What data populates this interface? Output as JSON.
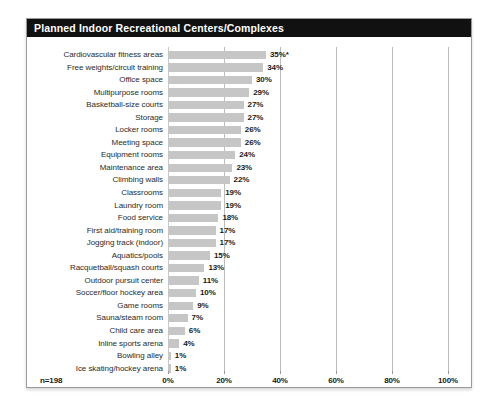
{
  "card": {
    "title": "Planned Indoor Recreational Centers/Complexes",
    "footnote": "n=198"
  },
  "axis": {
    "ticks": [
      "0%",
      "20%",
      "40%",
      "60%",
      "80%",
      "100%"
    ],
    "tick_values": [
      0,
      20,
      40,
      60,
      80,
      100
    ]
  },
  "colors": {
    "title_bar": "#111111",
    "title_text": "#ffffff",
    "bar_fill": "#c6c6c6",
    "gridline": "#bdbdbd",
    "card_border": "#9a9a9a",
    "label_text": "#2b2b2b",
    "value_text": "#1a1a1a"
  },
  "chart_data": {
    "type": "bar",
    "orientation": "horizontal",
    "title": "Planned Indoor Recreational Centers/Complexes",
    "xlabel": "",
    "ylabel": "",
    "xlim": [
      0,
      100
    ],
    "grid": true,
    "legend": null,
    "sample_size": "n=198",
    "annotations": [
      "35%* includes an asterisk footnote marker"
    ],
    "categories": [
      "Cardiovascular fitness areas",
      "Free weights/circuit training",
      "Office space",
      "Multipurpose rooms",
      "Basketball-size courts",
      "Storage",
      "Locker rooms",
      "Meeting space",
      "Equipment rooms",
      "Maintenance area",
      "Climbing walls",
      "Classrooms",
      "Laundry room",
      "Food service",
      "First aid/training room",
      "Jogging track (indoor)",
      "Aquatics/pools",
      "Racquetball/squash courts",
      "Outdoor pursuit center",
      "Soccer/floor hockey area",
      "Game rooms",
      "Sauna/steam room",
      "Child care area",
      "Inline sports arena",
      "Bowling alley",
      "Ice skating/hockey arena"
    ],
    "values": [
      35,
      34,
      30,
      29,
      27,
      27,
      26,
      26,
      24,
      23,
      22,
      19,
      19,
      18,
      17,
      17,
      15,
      13,
      11,
      10,
      9,
      7,
      6,
      4,
      1,
      1
    ],
    "value_labels": [
      "35%*",
      "34%",
      "30%",
      "29%",
      "27%",
      "27%",
      "26%",
      "26%",
      "24%",
      "23%",
      "22%",
      "19%",
      "19%",
      "18%",
      "17%",
      "17%",
      "15%",
      "13%",
      "11%",
      "10%",
      "9%",
      "7%",
      "6%",
      "4%",
      "1%",
      "1%"
    ]
  }
}
